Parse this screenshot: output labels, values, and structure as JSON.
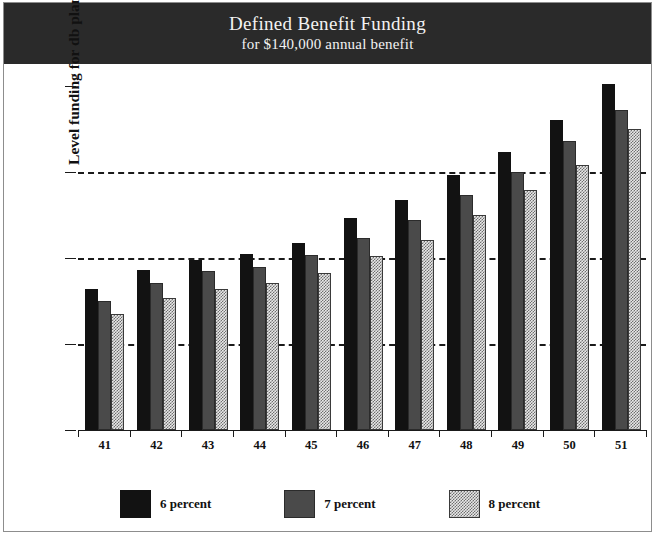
{
  "chart_data": {
    "type": "bar",
    "title": "Defined Benefit Funding",
    "subtitle": "for $140,000 annual benefit",
    "xlabel": "",
    "ylabel": "Level funding for db plan (int. only)",
    "categories": [
      "41",
      "42",
      "43",
      "44",
      "45",
      "46",
      "47",
      "48",
      "49",
      "50",
      "51"
    ],
    "series": [
      {
        "name": "6 percent",
        "color": "#121212",
        "values": [
          3290,
          3720,
          3950,
          4100,
          4350,
          4940,
          5340,
          5930,
          6470,
          7200,
          8050
        ]
      },
      {
        "name": "7 percent",
        "color": "#4a4a4a",
        "values": [
          3010,
          3410,
          3690,
          3790,
          4070,
          4470,
          4890,
          5460,
          6000,
          6730,
          7450
        ]
      },
      {
        "name": "8 percent",
        "color": "#9a9a9a",
        "values": [
          2700,
          3060,
          3290,
          3420,
          3650,
          4050,
          4420,
          4990,
          5580,
          6170,
          6990
        ]
      }
    ],
    "yticks": [
      0,
      2000,
      4000,
      6000,
      8000
    ],
    "ytick_labels": [
      "0",
      "2000",
      "4000",
      "6000",
      "8000"
    ],
    "ylim": [
      0,
      8000
    ],
    "gridlines_at": [
      2000,
      4000,
      6000
    ],
    "grid": true,
    "legend_position": "bottom"
  },
  "legend": {
    "items": [
      {
        "label": "6 percent"
      },
      {
        "label": "7 percent"
      },
      {
        "label": "8 percent"
      }
    ]
  }
}
